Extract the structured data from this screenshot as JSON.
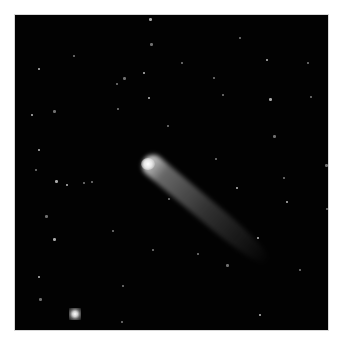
{
  "image": {
    "subject": "comet with tail in starfield",
    "background_color": "#020202",
    "border_color": "#d8d8d8",
    "comet": {
      "head": [
        133,
        149
      ],
      "tail_end": [
        253,
        250
      ],
      "color": "#e8e8e8"
    },
    "bright_star": [
      60,
      299
    ],
    "stars": [
      [
        148,
        17
      ],
      [
        72,
        54
      ],
      [
        238,
        36
      ],
      [
        37,
        67
      ],
      [
        149,
        42
      ],
      [
        180,
        61
      ],
      [
        265,
        58
      ],
      [
        306,
        61
      ],
      [
        122,
        76
      ],
      [
        142,
        71
      ],
      [
        212,
        76
      ],
      [
        221,
        93
      ],
      [
        268,
        97
      ],
      [
        309,
        95
      ],
      [
        115,
        82
      ],
      [
        147,
        96
      ],
      [
        52,
        109
      ],
      [
        116,
        107
      ],
      [
        30,
        113
      ],
      [
        166,
        124
      ],
      [
        272,
        134
      ],
      [
        37,
        148
      ],
      [
        214,
        157
      ],
      [
        34,
        168
      ],
      [
        54,
        179
      ],
      [
        82,
        181
      ],
      [
        90,
        180
      ],
      [
        65,
        183
      ],
      [
        324,
        163
      ],
      [
        282,
        176
      ],
      [
        235,
        186
      ],
      [
        167,
        197
      ],
      [
        44,
        214
      ],
      [
        285,
        200
      ],
      [
        325,
        207
      ],
      [
        111,
        229
      ],
      [
        52,
        237
      ],
      [
        151,
        248
      ],
      [
        196,
        252
      ],
      [
        256,
        236
      ],
      [
        225,
        263
      ],
      [
        298,
        268
      ],
      [
        37,
        275
      ],
      [
        121,
        284
      ],
      [
        38,
        297
      ],
      [
        258,
        313
      ],
      [
        120,
        320
      ]
    ]
  }
}
